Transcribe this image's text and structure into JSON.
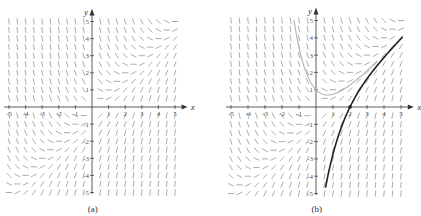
{
  "figure": {
    "equation": "dy/dx = x - y",
    "panels": [
      {
        "id": "a",
        "caption": "(a)",
        "origin_px": [
          92,
          107
        ],
        "unit_px": [
          16.6,
          17.1
        ],
        "x_range": [
          -5,
          5
        ],
        "y_range": [
          -5,
          5
        ],
        "x_axis_label": "x",
        "y_axis_label": "y",
        "x_ticks": [
          "-5",
          "-4",
          "-3",
          "-2",
          "-1",
          "1",
          "2",
          "3",
          "4",
          "5"
        ],
        "y_ticks": [
          "5",
          "4",
          "3",
          "2",
          "1",
          "-1",
          "-2",
          "-3",
          "-4",
          "-5"
        ],
        "field_spacing": 0.5,
        "curves": []
      },
      {
        "id": "b",
        "caption": "(b)",
        "origin_px": [
          316,
          107
        ],
        "unit_px": [
          17.0,
          17.3
        ],
        "x_range": [
          -5,
          5
        ],
        "y_range": [
          -5,
          5
        ],
        "x_axis_label": "x",
        "y_axis_label": "y",
        "x_ticks": [
          "-5",
          "-4",
          "-3",
          "-2",
          "-1",
          "1",
          "2",
          "3",
          "4",
          "5"
        ],
        "y_ticks": [
          "5",
          "4",
          "3",
          "2",
          "1",
          "-1",
          "-2",
          "-3",
          "-4",
          "-5"
        ],
        "field_spacing": 0.5,
        "curves": [
          {
            "name": "solution-through-2-0",
            "C": -7.389,
            "x_from": 0.56,
            "x_to": 5.1,
            "color": "#222222",
            "width": 1.6
          },
          {
            "name": "solution-gray",
            "C": 2.0,
            "x_from": -1.3,
            "x_to": 3.6,
            "color": "#b8b8b8",
            "width": 1.2
          }
        ],
        "marked_point": {
          "x": 2,
          "y": 0
        }
      }
    ]
  },
  "colors": {
    "field": "#8a8a8a",
    "axis": "#333333"
  }
}
